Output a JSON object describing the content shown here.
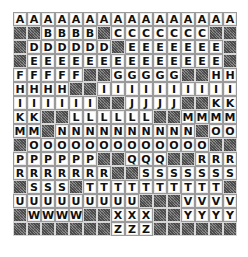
{
  "grid": {
    "columns": 16,
    "blank_marker": "#",
    "rows": [
      "AAAAAAAAAAAAAAAA",
      "##BBBB#CCCCCCC##",
      "#DDDDDD#EEEEEEE#",
      "#EEEEEEEEEEEEEE#",
      "FFFFF##GGGGG##HH",
      "HHHH##IIIIIIIIII",
      "IIIIII##JJJJ##KK",
      "KK##LLLLLL##MMMM",
      "MM#NNNNNNNNNN#OO",
      "#OOOOOOOOOOOOO##",
      "PPPPPP##QQQ##RRR",
      "RRRRRRR##SSSSSSS",
      "#SSS#TTTTTTTTTT#",
      "UUUUUUUUU###VVVV",
      "#WWWW##XXX##YYYY",
      "#######ZZZ######"
    ]
  },
  "colors": {
    "tile_bg": "#ffffff",
    "tile_border": "#9a9a9a",
    "blank_hatch": "#6e6e6e",
    "letter": "#111111"
  }
}
